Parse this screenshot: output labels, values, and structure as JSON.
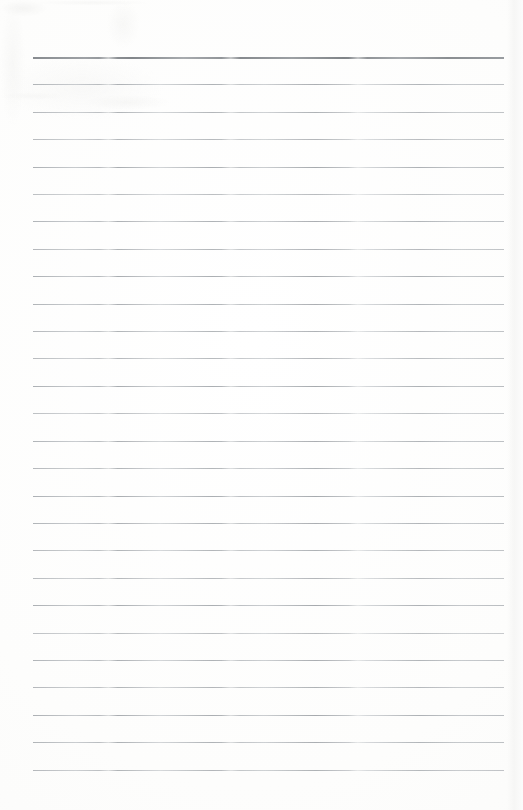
{
  "document": {
    "kind": "scanned-blank-lined-notebook-page",
    "title": "",
    "page_width": 523,
    "page_height": 810,
    "background_color": "#fdfdfc",
    "has_text_content": false,
    "text_lines": [],
    "header_text": "",
    "footer_text": "",
    "page_number": ""
  },
  "ruling": {
    "line_count": 27,
    "first_line_y": 57,
    "last_line_y": 770,
    "line_spacing": 27.4,
    "left_margin_x": 33,
    "right_margin_x": 504,
    "line_length": 471,
    "normal_line_color": "#a8acb0",
    "heavy_line_color": "#85898d",
    "normal_line_thickness": 1,
    "heavy_line_thickness": 2,
    "heavy_line_index": 0,
    "lines": [
      {
        "index": 0,
        "y": 57,
        "weight": "heavy",
        "content": ""
      },
      {
        "index": 1,
        "y": 84,
        "weight": "normal",
        "content": ""
      },
      {
        "index": 2,
        "y": 112,
        "weight": "normal",
        "content": ""
      },
      {
        "index": 3,
        "y": 139,
        "weight": "normal",
        "content": ""
      },
      {
        "index": 4,
        "y": 167,
        "weight": "normal",
        "content": ""
      },
      {
        "index": 5,
        "y": 194,
        "weight": "normal",
        "content": ""
      },
      {
        "index": 6,
        "y": 221,
        "weight": "normal",
        "content": ""
      },
      {
        "index": 7,
        "y": 249,
        "weight": "normal",
        "content": ""
      },
      {
        "index": 8,
        "y": 276,
        "weight": "normal",
        "content": ""
      },
      {
        "index": 9,
        "y": 304,
        "weight": "normal",
        "content": ""
      },
      {
        "index": 10,
        "y": 331,
        "weight": "normal",
        "content": ""
      },
      {
        "index": 11,
        "y": 358,
        "weight": "normal",
        "content": ""
      },
      {
        "index": 12,
        "y": 386,
        "weight": "normal",
        "content": ""
      },
      {
        "index": 13,
        "y": 413,
        "weight": "normal",
        "content": ""
      },
      {
        "index": 14,
        "y": 441,
        "weight": "normal",
        "content": ""
      },
      {
        "index": 15,
        "y": 468,
        "weight": "normal",
        "content": ""
      },
      {
        "index": 16,
        "y": 496,
        "weight": "normal",
        "content": ""
      },
      {
        "index": 17,
        "y": 523,
        "weight": "normal",
        "content": ""
      },
      {
        "index": 18,
        "y": 550,
        "weight": "normal",
        "content": ""
      },
      {
        "index": 19,
        "y": 578,
        "weight": "normal",
        "content": ""
      },
      {
        "index": 20,
        "y": 605,
        "weight": "normal",
        "content": ""
      },
      {
        "index": 21,
        "y": 633,
        "weight": "normal",
        "content": ""
      },
      {
        "index": 22,
        "y": 660,
        "weight": "normal",
        "content": ""
      },
      {
        "index": 23,
        "y": 687,
        "weight": "normal",
        "content": ""
      },
      {
        "index": 24,
        "y": 715,
        "weight": "normal",
        "content": ""
      },
      {
        "index": 25,
        "y": 742,
        "weight": "normal",
        "content": ""
      },
      {
        "index": 26,
        "y": 770,
        "weight": "normal",
        "content": ""
      }
    ]
  },
  "scan_artifacts": {
    "right_edge_band_x": 507,
    "right_edge_band_width": 16,
    "noise_opacity": 0.55
  }
}
